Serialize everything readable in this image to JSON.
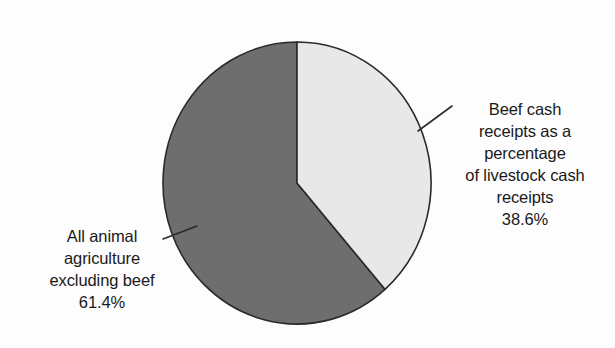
{
  "chart_data": {
    "type": "pie",
    "title": "",
    "subtitle": "",
    "xlabel": "",
    "ylabel": "",
    "legend_position": "none",
    "grid": false,
    "start_angle_deg": 0,
    "direction": "clockwise",
    "categories": [
      "Beef cash receipts as a percentage of livestock cash receipts",
      "All animal agriculture excluding beef"
    ],
    "values": [
      38.6,
      61.4
    ],
    "value_labels": [
      "38.6%",
      "61.4%"
    ],
    "units": "percent",
    "colors": [
      "#e8e8e8",
      "#6e6e6e"
    ],
    "slices": [
      {
        "name": "Beef cash receipts as a percentage of livestock cash receipts",
        "value": 38.6,
        "value_label": "38.6%",
        "color": "#e8e8e8",
        "start_angle_deg": 0,
        "end_angle_deg": 138.96
      },
      {
        "name": "All animal agriculture excluding beef",
        "value": 61.4,
        "value_label": "61.4%",
        "color": "#6e6e6e",
        "start_angle_deg": 138.96,
        "end_angle_deg": 360
      }
    ]
  },
  "labels": {
    "beef": {
      "lines": [
        "Beef cash",
        "receipts as a",
        "percentage",
        "of livestock cash",
        "receipts"
      ],
      "value": "38.6%"
    },
    "other": {
      "lines": [
        "All animal",
        "agriculture",
        "excluding beef"
      ],
      "value": "61.4%"
    }
  },
  "style": {
    "background": "#fdfdfd",
    "outline": "#2a2a2a",
    "text": "#1a1a1a",
    "slice_light": "#e8e8e8",
    "slice_dark": "#6e6e6e",
    "leader_line": "#2a2a2a"
  }
}
